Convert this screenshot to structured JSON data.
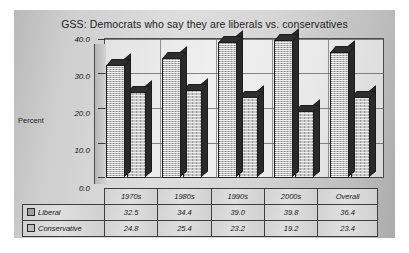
{
  "chart_data": {
    "type": "bar",
    "title": "GSS: Democrats who say they are liberals vs. conservatives",
    "xlabel": "",
    "ylabel": "Percent",
    "categories": [
      "1970s",
      "1980s",
      "1990s",
      "2000s",
      "Overall"
    ],
    "series": [
      {
        "name": "Liberal",
        "values": [
          32.5,
          34.4,
          39.0,
          39.8,
          36.4
        ]
      },
      {
        "name": "Conservative",
        "values": [
          24.8,
          25.4,
          23.2,
          19.2,
          23.4
        ]
      }
    ],
    "yticks": [
      "0.0",
      "10.0",
      "20.0",
      "30.0",
      "40.0"
    ],
    "ytick_values": [
      0,
      10,
      20,
      30,
      40
    ],
    "ylim": [
      0,
      40
    ],
    "grid": true,
    "legend_position": "data-table-row-labels",
    "style": "3d-column-grayscale",
    "colors": {
      "series_liberal": "#b7b7b7",
      "series_conservative": "#c6c6c6",
      "plot_background": "#e9e9e9",
      "chart_background": "#cfcfcf",
      "axis": "#3d3d3d"
    }
  },
  "table": {
    "header": [
      "",
      "1970s",
      "1980s",
      "1990s",
      "2000s",
      "Overall"
    ],
    "rows": [
      {
        "label": "Liberal",
        "cells": [
          "32.5",
          "34.4",
          "39.0",
          "39.8",
          "36.4"
        ]
      },
      {
        "label": "Conservative",
        "cells": [
          "24.8",
          "25.4",
          "23.2",
          "19.2",
          "23.4"
        ]
      }
    ]
  },
  "icons": {
    "legend_marker_liberal": "square-swatch-icon",
    "legend_marker_conservative": "square-swatch-icon"
  }
}
